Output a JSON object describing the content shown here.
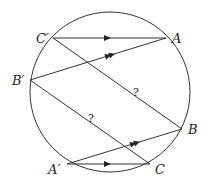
{
  "diagram": {
    "type": "geometry",
    "circle": {
      "cx": 110,
      "cy": 92,
      "r": 80
    },
    "points": {
      "C_prime": {
        "label": "C′",
        "x": 53,
        "y": 38
      },
      "A": {
        "label": "A",
        "x": 166,
        "y": 38
      },
      "B_prime": {
        "label": "B′",
        "x": 30,
        "y": 80
      },
      "B": {
        "label": "B",
        "x": 182,
        "y": 129
      },
      "A_prime": {
        "label": "A′",
        "x": 67,
        "y": 164
      },
      "C": {
        "label": "C",
        "x": 150,
        "y": 164
      }
    },
    "segments": [
      {
        "from": "C_prime",
        "to": "A",
        "marker": "single-arrow"
      },
      {
        "from": "B_prime",
        "to": "A",
        "marker": "double-arrow"
      },
      {
        "from": "C_prime",
        "to": "B",
        "marker": "question",
        "note": "?"
      },
      {
        "from": "B_prime",
        "to": "C",
        "marker": "question",
        "note": "?"
      },
      {
        "from": "A_prime",
        "to": "B",
        "marker": "double-arrow"
      },
      {
        "from": "A_prime",
        "to": "C",
        "marker": "single-arrow"
      }
    ],
    "annotations": [
      "?",
      "?"
    ],
    "color": "#222222"
  }
}
